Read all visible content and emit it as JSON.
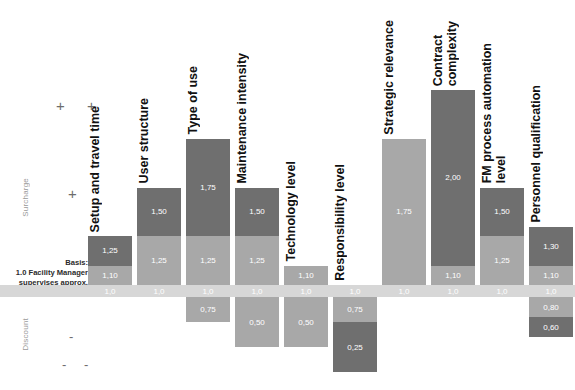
{
  "axis": {
    "surcharge_label": "Surcharge",
    "discount_label": "Discount",
    "sign_plus_plus": "+  +",
    "sign_plus": "+",
    "sign_minus": "-",
    "sign_minus_minus": "-  -"
  },
  "basis_note": {
    "line1": "Basis:",
    "line2": "1.0 Facility Manager",
    "line3": "supervises approx.",
    "line4": "40.000 m²"
  },
  "colors": {
    "dark": "#6f6f6f",
    "mid": "#a8a8a8",
    "base": "#d7d7d7",
    "background": "#ffffff",
    "label_text": "#111111",
    "axis_text": "#9a9a9a"
  },
  "chart_data": {
    "type": "bar",
    "title": "",
    "xlabel": "",
    "ylabel": "",
    "baseline": "1,0",
    "baseline_value": 1.0,
    "ylim": [
      0.25,
      2.0
    ],
    "grid": false,
    "legend": "none",
    "categories": [
      "Setup and travel time",
      "User structure",
      "Type of use",
      "Maintenance intensity",
      "Technology level",
      "Responsibility level",
      "Strategic relevance",
      "Contract complexity",
      "FM process automation\nlevel",
      "Personnel qualification"
    ],
    "columns": [
      {
        "name": "Setup and travel time",
        "label": "Setup and travel time",
        "above": [
          {
            "value": 1.1,
            "text": "1,10",
            "tone": "mid"
          },
          {
            "value": 1.25,
            "text": "1,25",
            "tone": "dark"
          }
        ],
        "below": []
      },
      {
        "name": "User structure",
        "label": "User structure",
        "above": [
          {
            "value": 1.25,
            "text": "1,25",
            "tone": "mid"
          },
          {
            "value": 1.5,
            "text": "1,50",
            "tone": "dark"
          }
        ],
        "below": []
      },
      {
        "name": "Type of use",
        "label": "Type of use",
        "above": [
          {
            "value": 1.25,
            "text": "1,25",
            "tone": "mid"
          },
          {
            "value": 1.75,
            "text": "1,75",
            "tone": "dark"
          }
        ],
        "below": [
          {
            "value": 0.75,
            "text": "0,75",
            "tone": "mid"
          }
        ]
      },
      {
        "name": "Maintenance intensity",
        "label": "Maintenance intensity",
        "above": [
          {
            "value": 1.25,
            "text": "1,25",
            "tone": "mid"
          },
          {
            "value": 1.5,
            "text": "1,50",
            "tone": "dark"
          }
        ],
        "below": [
          {
            "value": 0.5,
            "text": "0,50",
            "tone": "mid"
          }
        ]
      },
      {
        "name": "Technology level",
        "label": "Technology level",
        "above": [
          {
            "value": 1.1,
            "text": "1,10",
            "tone": "mid"
          }
        ],
        "below": [
          {
            "value": 0.5,
            "text": "0,50",
            "tone": "mid"
          }
        ]
      },
      {
        "name": "Responsibility level",
        "label": "Responsibility level",
        "above": [],
        "below": [
          {
            "value": 0.75,
            "text": "0,75",
            "tone": "mid"
          },
          {
            "value": 0.25,
            "text": "0,25",
            "tone": "dark"
          }
        ]
      },
      {
        "name": "Strategic relevance",
        "label": "Strategic relevance",
        "above": [
          {
            "value": 1.75,
            "text": "1,75",
            "tone": "mid"
          }
        ],
        "below": []
      },
      {
        "name": "Contract complexity",
        "label": "Contract\ncomplexity",
        "above": [
          {
            "value": 1.1,
            "text": "1,10",
            "tone": "mid"
          },
          {
            "value": 2.0,
            "text": "2,00",
            "tone": "dark"
          }
        ],
        "below": []
      },
      {
        "name": "FM process automation level",
        "label": "FM process automation\nlevel",
        "above": [
          {
            "value": 1.25,
            "text": "1,25",
            "tone": "mid"
          },
          {
            "value": 1.5,
            "text": "1,50",
            "tone": "dark"
          }
        ],
        "below": []
      },
      {
        "name": "Personnel qualification",
        "label": "Personnel qualification",
        "above": [
          {
            "value": 1.1,
            "text": "1,10",
            "tone": "mid"
          },
          {
            "value": 1.3,
            "text": "1,30",
            "tone": "dark"
          }
        ],
        "below": [
          {
            "value": 0.8,
            "text": "0,80",
            "tone": "mid"
          },
          {
            "value": 0.6,
            "text": "0,60",
            "tone": "dark"
          }
        ]
      }
    ]
  }
}
